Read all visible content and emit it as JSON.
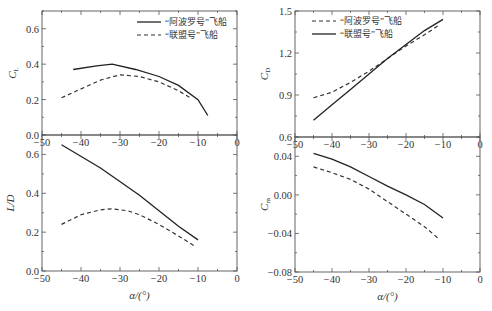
{
  "chart_data": [
    {
      "id": "cl",
      "type": "line",
      "ylabel": "C_L",
      "xlabel": "",
      "xlim": [
        -50,
        0
      ],
      "ylim": [
        0.0,
        0.7
      ],
      "xticks": [
        -50,
        -40,
        -30,
        -20,
        -10,
        0
      ],
      "yticks": [
        0.0,
        0.2,
        0.4,
        0.6
      ],
      "ytick_labels": [
        "0.0",
        "0.2",
        "0.4",
        "0.6"
      ],
      "legend": [
        {
          "label": "“阿波罗号”飞船",
          "style": "solid"
        },
        {
          "label": "“联盟号”飞船",
          "style": "dashed"
        }
      ],
      "series": [
        {
          "name": "“阿波罗号”飞船",
          "style": "solid",
          "x": [
            -42,
            -36,
            -32,
            -26,
            -20,
            -15,
            -10,
            -7.5
          ],
          "y": [
            0.37,
            0.39,
            0.4,
            0.37,
            0.33,
            0.28,
            0.2,
            0.11
          ]
        },
        {
          "name": "“联盟号”飞船",
          "style": "dashed",
          "x": [
            -45,
            -40,
            -35,
            -30,
            -25,
            -20,
            -15,
            -12
          ],
          "y": [
            0.21,
            0.26,
            0.31,
            0.34,
            0.33,
            0.3,
            0.25,
            0.21
          ]
        }
      ]
    },
    {
      "id": "cd",
      "type": "line",
      "ylabel": "C_D",
      "xlabel": "",
      "xlim": [
        -50,
        0
      ],
      "ylim": [
        0.6,
        1.5
      ],
      "xticks": [
        -50,
        -40,
        -30,
        -20,
        -10,
        0
      ],
      "yticks": [
        0.6,
        0.9,
        1.2,
        1.5
      ],
      "ytick_labels": [
        "0.6",
        "0.9",
        "1.2",
        "1.5"
      ],
      "legend": [
        {
          "label": "“阿波罗号”飞船",
          "style": "dashed"
        },
        {
          "label": "“联盟号”飞船",
          "style": "solid"
        }
      ],
      "series": [
        {
          "name": "“阿波罗号”飞船",
          "style": "dashed",
          "x": [
            -45,
            -40,
            -35,
            -30,
            -25,
            -20,
            -15,
            -11
          ],
          "y": [
            0.88,
            0.92,
            0.99,
            1.07,
            1.16,
            1.25,
            1.33,
            1.4
          ]
        },
        {
          "name": "“联盟号”飞船",
          "style": "solid",
          "x": [
            -45,
            -40,
            -35,
            -30,
            -25,
            -20,
            -15,
            -10
          ],
          "y": [
            0.72,
            0.83,
            0.94,
            1.05,
            1.16,
            1.26,
            1.36,
            1.44
          ]
        }
      ]
    },
    {
      "id": "ld",
      "type": "line",
      "ylabel": "L/D",
      "xlabel": "α/(°)",
      "xlim": [
        -50,
        0
      ],
      "ylim": [
        0.0,
        0.7
      ],
      "xticks": [
        -50,
        -40,
        -30,
        -20,
        -10,
        0
      ],
      "yticks": [
        0.0,
        0.2,
        0.4,
        0.6
      ],
      "ytick_labels": [
        "0.0",
        "0.2",
        "0.4",
        "0.6"
      ],
      "series": [
        {
          "name": "“阿波罗号”飞船",
          "style": "solid",
          "x": [
            -45,
            -35,
            -25,
            -20,
            -15,
            -10
          ],
          "y": [
            0.65,
            0.53,
            0.39,
            0.31,
            0.23,
            0.16
          ]
        },
        {
          "name": "“联盟号”飞船",
          "style": "dashed",
          "x": [
            -45,
            -40,
            -35,
            -32,
            -28,
            -25,
            -20,
            -15,
            -11
          ],
          "y": [
            0.24,
            0.29,
            0.315,
            0.32,
            0.31,
            0.29,
            0.24,
            0.18,
            0.13
          ]
        }
      ]
    },
    {
      "id": "cm",
      "type": "line",
      "ylabel": "C_m",
      "xlabel": "α/(°)",
      "xlim": [
        -50,
        0
      ],
      "ylim": [
        -0.08,
        0.06
      ],
      "xticks": [
        -50,
        -40,
        -30,
        -20,
        -10,
        0
      ],
      "yticks": [
        -0.08,
        -0.04,
        0.0,
        0.04
      ],
      "ytick_labels": [
        "−0.08",
        "−0.04",
        "0.00",
        "0.04"
      ],
      "series": [
        {
          "name": "“阿波罗号”飞船",
          "style": "solid",
          "x": [
            -45,
            -40,
            -35,
            -30,
            -25,
            -20,
            -15,
            -10
          ],
          "y": [
            0.043,
            0.037,
            0.029,
            0.019,
            0.009,
            0.0,
            -0.01,
            -0.024
          ]
        },
        {
          "name": "“联盟号”飞船",
          "style": "dashed",
          "x": [
            -45,
            -40,
            -35,
            -30,
            -25,
            -20,
            -15,
            -11
          ],
          "y": [
            0.029,
            0.023,
            0.016,
            0.006,
            -0.007,
            -0.02,
            -0.033,
            -0.046
          ]
        }
      ]
    }
  ],
  "xtick_labels": [
    "−50",
    "−40",
    "−30",
    "−20",
    "−10",
    "0"
  ]
}
